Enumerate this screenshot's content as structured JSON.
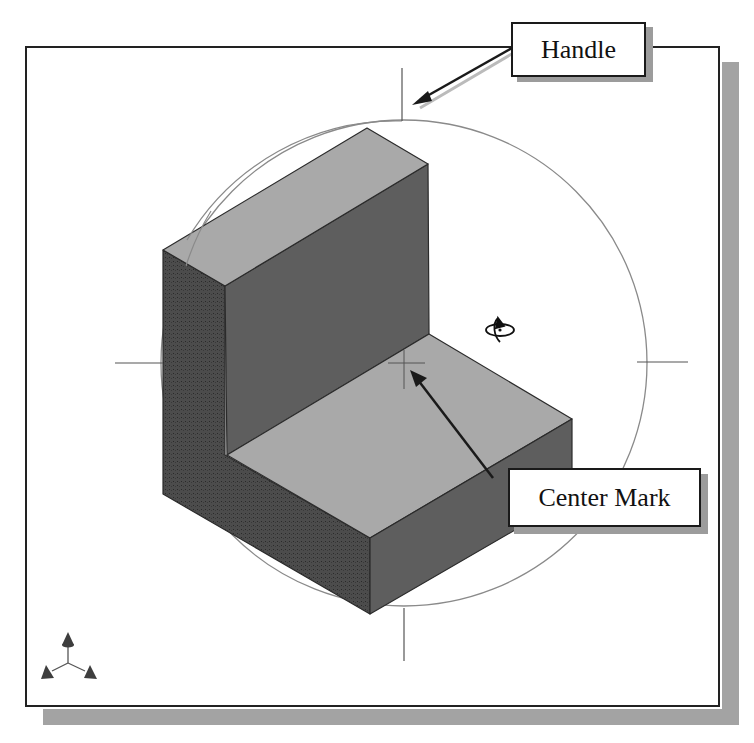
{
  "viewport": {
    "shadow_color": "#a3a3a3",
    "border_color": "#222222",
    "background": "#ffffff"
  },
  "model": {
    "type": "L-bracket solid (isometric view)",
    "top_face_color": "#a9a9a9",
    "front_face_color": "#5e5e5e",
    "side_face_color": "#4c4c4c"
  },
  "rotation_aid": {
    "circle_color": "#8a8a8a",
    "center_mark": {
      "x": 404,
      "y": 363
    },
    "radius": 243
  },
  "callouts": {
    "handle": {
      "label": "Handle"
    },
    "center_mark": {
      "label": "Center Mark"
    }
  },
  "icons": {
    "rotate_cursor": "rotate-cursor-icon",
    "triad": "axis-triad-icon"
  }
}
